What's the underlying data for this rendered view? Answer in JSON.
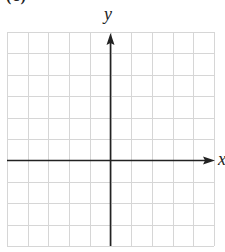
{
  "figure": {
    "part_label": "(c)",
    "axes": {
      "x_label": "x",
      "y_label": "y"
    },
    "grid": {
      "columns": 10,
      "rows": 10,
      "origin_column": 5,
      "origin_row_from_top": 6,
      "line_color": "#d6d6d6",
      "axis_color": "#222222"
    }
  }
}
